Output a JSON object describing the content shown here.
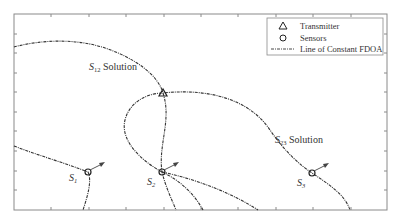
{
  "figure": {
    "frame": {
      "x0": 14,
      "y0": 14,
      "x1": 387,
      "y1": 210
    },
    "x_ticks": [
      51,
      89,
      126,
      164,
      201,
      238,
      276,
      313,
      351
    ],
    "y_ticks": [
      34,
      53,
      73,
      92,
      112,
      131,
      151,
      171,
      190
    ]
  },
  "legend": {
    "items": [
      {
        "label": "Transmitter",
        "symbol": "triangle"
      },
      {
        "label": "Sensors",
        "symbol": "circle"
      },
      {
        "label": "Line of Constant FDOA",
        "symbol": "dash-dot-line"
      }
    ]
  },
  "labels": {
    "s12": {
      "base": "S",
      "sub": "12",
      "suffix": " Solution"
    },
    "s23": {
      "base": "S",
      "sub": "23",
      "suffix": " Solution"
    }
  },
  "sensors": [
    {
      "name": "S",
      "sub": "1",
      "x": 88,
      "y": 172
    },
    {
      "name": "S",
      "sub": "2",
      "x": 162,
      "y": 172
    },
    {
      "name": "S",
      "sub": "3",
      "x": 312,
      "y": 173
    }
  ],
  "transmitter": {
    "x": 163,
    "y": 93
  }
}
